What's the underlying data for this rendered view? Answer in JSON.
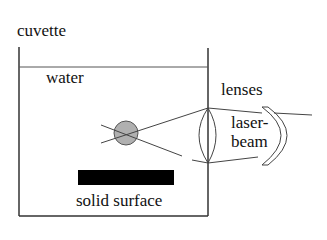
{
  "diagram": {
    "labels": {
      "cuvette": "cuvette",
      "water": "water",
      "lenses": "lenses",
      "laser_line1": "laser-",
      "laser_line2": "beam",
      "solid_surface": "solid surface"
    },
    "colors": {
      "stroke": "#333333",
      "particle_fill": "#b0b0b0",
      "surface_fill": "#000000"
    }
  }
}
